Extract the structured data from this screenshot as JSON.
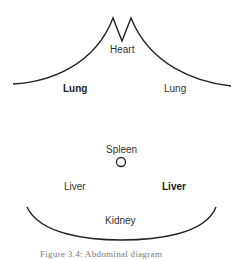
{
  "diagram": {
    "labels": {
      "heart": "Heart",
      "lung_left": "Lung",
      "lung_right": "Lung",
      "spleen": "Spleen",
      "liver_left": "Liver",
      "liver_right": "Liver",
      "kidney": "Kidney"
    },
    "bold_labels": [
      "lung_left",
      "liver_right"
    ],
    "caption": "Figure 3.4: Abdominal diagram"
  }
}
